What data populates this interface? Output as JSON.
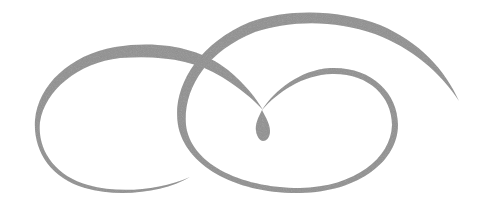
{
  "ornament": {
    "description": "decorative double-loop swirl flourish",
    "fill_color": "#8f8f8f",
    "background_color": "#ffffff"
  }
}
